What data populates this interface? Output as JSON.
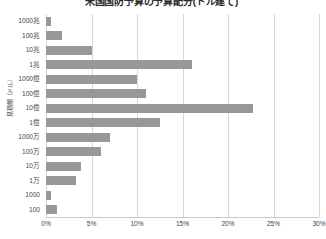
{
  "chart_data": {
    "type": "bar",
    "orientation": "horizontal",
    "title": "米国国防予算の予算配分(ドル建て)",
    "xlabel": "",
    "ylabel": "見積額（ドル）",
    "xlim": [
      0,
      30
    ],
    "xunit": "%",
    "grid": true,
    "legend": false,
    "bar_color": "#989898",
    "gridline_color": "#d6d6d6",
    "categories": [
      "1000兆",
      "100兆",
      "10兆",
      "1兆",
      "1000億",
      "100億",
      "10億",
      "1億",
      "1000万",
      "100万",
      "10万",
      "1万",
      "1000",
      "100"
    ],
    "values": [
      0.5,
      1.8,
      5.0,
      16.0,
      10.0,
      11.0,
      22.7,
      12.5,
      7.0,
      6.0,
      3.8,
      3.3,
      0.6,
      1.2
    ],
    "xticks": [
      0,
      5,
      10,
      15,
      20,
      25,
      30
    ],
    "xticklabels": [
      "0%",
      "5%",
      "10%",
      "15%",
      "20%",
      "25%",
      "30%"
    ]
  }
}
